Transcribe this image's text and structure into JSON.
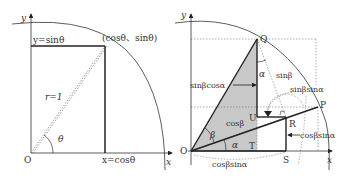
{
  "left_diagram": {
    "axis_x_label": "x",
    "axis_y_label": "y",
    "origin_label": "O",
    "point_label": "(cosθ、sinθ)",
    "y_proj_label": "y=sinθ",
    "x_proj_label": "x=cosθ",
    "radius_label": "r=1",
    "angle_label": "θ"
  },
  "right_diagram": {
    "axis_x_label": "x",
    "axis_y_label": "y",
    "points": {
      "O": "O",
      "Q": "Q",
      "P": "P",
      "R": "R",
      "S": "S",
      "T": "T",
      "U": "U"
    },
    "angles": {
      "alpha_bottom": "α",
      "alpha_top": "α",
      "beta": "β"
    },
    "labels": {
      "sinb_cosa": "sinβcosα",
      "sinb": "sinβ",
      "sinb_sina": "sinβsinα",
      "cosb": "cosβ",
      "cosb_sina_right": "cosβsinα",
      "cosb_sina_bottom": "cosβsinα"
    },
    "colors": {
      "shaded_triangle": "#c8c8c8",
      "line": "#333333"
    }
  }
}
